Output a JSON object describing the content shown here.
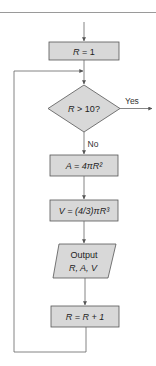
{
  "diagram": {
    "type": "flowchart",
    "colors": {
      "box_fill": "#d8d8d8",
      "box_stroke": "#555555",
      "line": "#666666",
      "rule": "#9a9a9a"
    },
    "nodes": [
      {
        "id": "init",
        "shape": "rectangle",
        "text_var": "R",
        "text_rest": " = 1"
      },
      {
        "id": "decision",
        "shape": "diamond",
        "text_var": "R",
        "text_rest": " > 10?"
      },
      {
        "id": "area",
        "shape": "rectangle",
        "text": "A = 4πR²"
      },
      {
        "id": "volume",
        "shape": "rectangle",
        "text": "V = (4/3)πR³"
      },
      {
        "id": "output",
        "shape": "parallelogram",
        "line1": "Output",
        "line2": "R, A, V"
      },
      {
        "id": "increment",
        "shape": "rectangle",
        "text": "R = R + 1"
      }
    ],
    "edges": [
      {
        "from": "start",
        "to": "init"
      },
      {
        "from": "init",
        "to": "decision"
      },
      {
        "from": "decision",
        "to": "end",
        "label": "Yes"
      },
      {
        "from": "decision",
        "to": "area",
        "label": "No"
      },
      {
        "from": "area",
        "to": "volume"
      },
      {
        "from": "volume",
        "to": "output"
      },
      {
        "from": "output",
        "to": "increment"
      },
      {
        "from": "increment",
        "to": "decision",
        "label": ""
      }
    ],
    "labels": {
      "yes": "Yes",
      "no": "No"
    }
  }
}
